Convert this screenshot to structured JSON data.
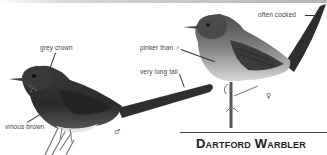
{
  "title": "Dartford Warbler",
  "labels": {
    "grey_crown": "grey crown",
    "vinous_brown": "vinous brown",
    "pinker_than_male": "pinker than ♂",
    "very_long_tail": "very long tail",
    "often_cocked": "often cocked"
  },
  "sex_symbols": {
    "male": "♂",
    "female": "♀"
  },
  "colors": {
    "bird_dark": "#2e2e2e",
    "bird_mid": "#5a5a5a",
    "bird_light": "#cfcfcf",
    "rule": "#4a4a4a",
    "title": "#1e1e1e"
  }
}
